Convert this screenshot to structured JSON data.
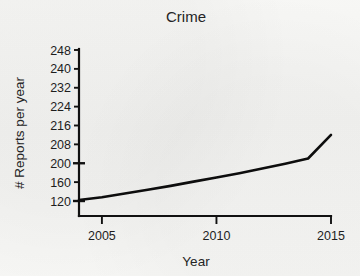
{
  "chart_data": {
    "type": "line",
    "title": "Crime",
    "xlabel": "Year",
    "ylabel": "# Reports per year",
    "x": [
      2004,
      2005,
      2006,
      2007,
      2008,
      2009,
      2010,
      2011,
      2012,
      2013,
      2014,
      2015
    ],
    "values": [
      122,
      128,
      136,
      144,
      152,
      161,
      170,
      179,
      189,
      199,
      202,
      212
    ],
    "series": [
      {
        "name": "Reports per year",
        "values": [
          122,
          128,
          136,
          144,
          152,
          161,
          170,
          179,
          189,
          199,
          202,
          212
        ]
      }
    ],
    "xticks": [
      2005,
      2010,
      2015
    ],
    "xticklabels": [
      "2005",
      "2010",
      "2015"
    ],
    "xlim": [
      2004,
      2015
    ],
    "yticks": [
      120,
      160,
      200,
      208,
      216,
      224,
      232,
      240,
      248
    ],
    "yticklabels": [
      "120",
      "160",
      "200",
      "208",
      "216",
      "224",
      "232",
      "240",
      "248"
    ],
    "ylim": [
      120,
      248
    ],
    "y_axis_scale": "non-linear-evenly-spaced-ticks",
    "grid": false,
    "legend": false,
    "line_color": "#0d0d0d"
  },
  "style": {
    "background": "#f4f4f2",
    "ink": "#111111"
  }
}
